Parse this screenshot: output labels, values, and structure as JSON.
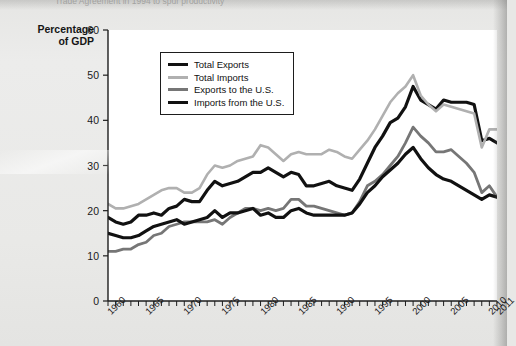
{
  "caption": {
    "top_partial": "Trade Agreement in 1994 to spur productivity"
  },
  "axis_title": {
    "line1": "Percentage",
    "line2": "of GDP"
  },
  "colors": {
    "total_exports": "#111111",
    "total_imports": "#b0b0b0",
    "exports_to_us": "#767676",
    "imports_from_us": "#111111",
    "plot_background": "#ffffff",
    "page_background": "#e8e8e6",
    "axis": "#1d1d1d"
  },
  "legend": {
    "position": "top-left-inside",
    "entries": [
      {
        "label": "Total Exports",
        "color": "#111111",
        "weight": 3.2
      },
      {
        "label": "Total Imports",
        "color": "#b0b0b0",
        "weight": 2.6
      },
      {
        "label": "Exports to the U.S.",
        "color": "#767676",
        "weight": 2.8
      },
      {
        "label": "Imports from the U.S.",
        "color": "#111111",
        "weight": 3.2
      }
    ]
  },
  "chart_data": {
    "type": "line",
    "title": "",
    "subtitle": "",
    "xlabel": "",
    "ylabel": "Percentage of GDP",
    "xlim": [
      1960,
      2011
    ],
    "ylim": [
      0,
      60
    ],
    "yticks": [
      0,
      10,
      20,
      30,
      40,
      50,
      60
    ],
    "xticks": [
      1960,
      1965,
      1970,
      1975,
      1980,
      1985,
      1990,
      1995,
      2000,
      2005,
      2010,
      2011
    ],
    "xtick_minor_every": 1,
    "grid": false,
    "legend_position": "upper-left",
    "x": [
      1960,
      1961,
      1962,
      1963,
      1964,
      1965,
      1966,
      1967,
      1968,
      1969,
      1970,
      1971,
      1972,
      1973,
      1974,
      1975,
      1976,
      1977,
      1978,
      1979,
      1980,
      1981,
      1982,
      1983,
      1984,
      1985,
      1986,
      1987,
      1988,
      1989,
      1990,
      1991,
      1992,
      1993,
      1994,
      1995,
      1996,
      1997,
      1998,
      1999,
      2000,
      2001,
      2002,
      2003,
      2004,
      2005,
      2006,
      2007,
      2008,
      2009,
      2010,
      2011
    ],
    "series": [
      {
        "name": "Total Exports",
        "color": "#111111",
        "values": [
          18.5,
          17.5,
          17.0,
          17.5,
          19.0,
          19.0,
          19.5,
          19.0,
          20.5,
          21.0,
          22.5,
          22.0,
          22.0,
          24.5,
          26.5,
          25.5,
          26.0,
          26.5,
          27.5,
          28.5,
          28.5,
          29.5,
          28.5,
          27.5,
          28.5,
          28.0,
          25.5,
          25.5,
          26.0,
          26.5,
          25.5,
          25.0,
          24.5,
          27.0,
          30.5,
          34.0,
          36.5,
          39.5,
          40.5,
          43.0,
          47.5,
          44.5,
          43.5,
          42.5,
          44.5,
          44.0,
          44.0,
          44.0,
          43.5,
          35.5,
          36.0,
          35.0
        ]
      },
      {
        "name": "Total Imports",
        "color": "#b0b0b0",
        "values": [
          21.5,
          20.5,
          20.5,
          21.0,
          21.5,
          22.5,
          23.5,
          24.5,
          25.0,
          25.0,
          24.0,
          24.0,
          25.0,
          28.0,
          30.0,
          29.5,
          30.0,
          31.0,
          31.5,
          32.0,
          34.5,
          34.0,
          32.5,
          31.0,
          32.5,
          33.0,
          32.5,
          32.5,
          32.5,
          33.5,
          33.0,
          32.0,
          31.5,
          33.5,
          35.5,
          38.0,
          41.0,
          44.0,
          46.0,
          47.5,
          50.0,
          45.5,
          43.5,
          42.0,
          43.5,
          43.0,
          42.5,
          42.0,
          41.5,
          34.0,
          38.0,
          38.0
        ]
      },
      {
        "name": "Exports to the U.S.",
        "color": "#767676",
        "values": [
          11.0,
          11.0,
          11.5,
          11.5,
          12.5,
          13.0,
          14.5,
          15.0,
          16.5,
          17.0,
          17.5,
          17.5,
          17.5,
          17.5,
          18.0,
          17.0,
          18.5,
          19.5,
          20.5,
          20.5,
          20.0,
          20.5,
          20.0,
          20.5,
          22.5,
          22.5,
          21.0,
          21.0,
          20.5,
          20.0,
          19.5,
          19.0,
          19.5,
          22.0,
          25.5,
          26.5,
          28.0,
          30.0,
          32.0,
          35.0,
          38.5,
          36.5,
          35.0,
          33.0,
          33.0,
          33.5,
          32.0,
          30.5,
          28.5,
          24.0,
          25.5,
          23.0
        ]
      },
      {
        "name": "Imports from the U.S.",
        "color": "#111111",
        "values": [
          15.0,
          14.5,
          14.0,
          14.0,
          14.5,
          15.5,
          16.5,
          17.0,
          17.5,
          18.0,
          17.0,
          17.5,
          18.0,
          18.5,
          20.0,
          18.5,
          19.5,
          19.5,
          20.0,
          20.5,
          19.0,
          19.5,
          18.5,
          18.5,
          20.0,
          20.5,
          19.5,
          19.0,
          19.0,
          19.0,
          19.0,
          19.0,
          19.5,
          21.5,
          24.0,
          25.5,
          27.5,
          29.0,
          30.5,
          32.5,
          34.0,
          31.5,
          29.5,
          28.0,
          27.0,
          26.5,
          25.5,
          24.5,
          23.5,
          22.5,
          23.5,
          23.0
        ]
      }
    ]
  }
}
